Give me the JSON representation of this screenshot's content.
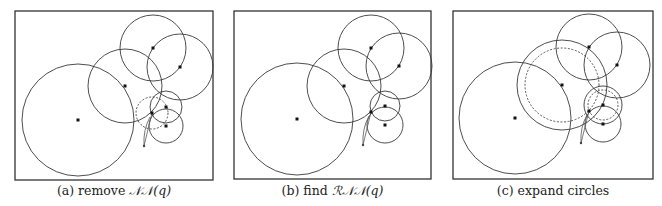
{
  "figure": {
    "panels": [
      {
        "id": "a",
        "caption_prefix": "(a) remove ",
        "caption_math": "𝒩𝒩(q)",
        "points": [
          {
            "name": "p-big",
            "x": 78,
            "y": 120
          },
          {
            "name": "p-mid",
            "x": 125,
            "y": 86
          },
          {
            "name": "p-top",
            "x": 153,
            "y": 48
          },
          {
            "name": "p-right",
            "x": 180,
            "y": 67
          },
          {
            "name": "p-small-upper",
            "x": 166,
            "y": 107
          },
          {
            "name": "p-small-lower",
            "x": 166,
            "y": 126
          },
          {
            "name": "p-nn",
            "x": 152,
            "y": 113
          }
        ],
        "circles": [
          {
            "name": "circle-big",
            "cx": 78,
            "cy": 120,
            "r": 56,
            "style": "solid"
          },
          {
            "name": "circle-mid",
            "cx": 125,
            "cy": 86,
            "r": 37,
            "style": "solid"
          },
          {
            "name": "circle-top",
            "cx": 153,
            "cy": 48,
            "r": 33,
            "style": "solid"
          },
          {
            "name": "circle-right",
            "cx": 180,
            "cy": 67,
            "r": 33,
            "style": "solid"
          },
          {
            "name": "circle-small-upper",
            "cx": 166,
            "cy": 107,
            "r": 16,
            "style": "solid"
          },
          {
            "name": "circle-small-lower",
            "cx": 166,
            "cy": 126,
            "r": 17,
            "style": "solid"
          },
          {
            "name": "circle-nn-removed",
            "cx": 152,
            "cy": 113,
            "r": 16,
            "style": "dashed"
          }
        ],
        "query": {
          "x": 144,
          "y": 146,
          "target": {
            "x": 152,
            "y": 113
          }
        }
      },
      {
        "id": "b",
        "caption_prefix": "(b) find ",
        "caption_math": "ℛ𝒩𝒩(q)",
        "points": [
          {
            "name": "p-big",
            "x": 297,
            "y": 119
          },
          {
            "name": "p-mid",
            "x": 344,
            "y": 86
          },
          {
            "name": "p-top",
            "x": 371,
            "y": 48
          },
          {
            "name": "p-right",
            "x": 399,
            "y": 66
          },
          {
            "name": "p-small-upper",
            "x": 385,
            "y": 106
          },
          {
            "name": "p-small-lower",
            "x": 385,
            "y": 125
          },
          {
            "name": "p-nn",
            "x": 371,
            "y": 112
          }
        ],
        "circles": [
          {
            "name": "circle-big",
            "cx": 297,
            "cy": 119,
            "r": 56,
            "style": "solid"
          },
          {
            "name": "circle-mid",
            "cx": 344,
            "cy": 86,
            "r": 37,
            "style": "solid"
          },
          {
            "name": "circle-top",
            "cx": 371,
            "cy": 48,
            "r": 33,
            "style": "solid"
          },
          {
            "name": "circle-right",
            "cx": 399,
            "cy": 66,
            "r": 33,
            "style": "solid"
          },
          {
            "name": "circle-small-upper",
            "cx": 385,
            "cy": 106,
            "r": 15,
            "style": "solid"
          },
          {
            "name": "circle-small-lower",
            "cx": 385,
            "cy": 125,
            "r": 18,
            "style": "solid"
          }
        ],
        "query": {
          "x": 363,
          "y": 145,
          "target": {
            "x": 371,
            "y": 112
          }
        }
      },
      {
        "id": "c",
        "caption_prefix": "(c) expand circles",
        "caption_math": "",
        "points": [
          {
            "name": "p-big",
            "x": 515,
            "y": 118
          },
          {
            "name": "p-mid",
            "x": 562,
            "y": 85
          },
          {
            "name": "p-top",
            "x": 589,
            "y": 47
          },
          {
            "name": "p-right",
            "x": 617,
            "y": 65
          },
          {
            "name": "p-small-upper",
            "x": 603,
            "y": 105
          },
          {
            "name": "p-small-lower",
            "x": 603,
            "y": 124
          },
          {
            "name": "p-nn",
            "x": 589,
            "y": 111
          }
        ],
        "circles": [
          {
            "name": "circle-big",
            "cx": 515,
            "cy": 118,
            "r": 56,
            "style": "solid"
          },
          {
            "name": "circle-mid-original",
            "cx": 562,
            "cy": 85,
            "r": 37,
            "style": "dashed"
          },
          {
            "name": "circle-mid-expanded",
            "cx": 562,
            "cy": 85,
            "r": 45,
            "style": "solid"
          },
          {
            "name": "circle-top",
            "cx": 589,
            "cy": 47,
            "r": 33,
            "style": "solid"
          },
          {
            "name": "circle-right",
            "cx": 617,
            "cy": 65,
            "r": 33,
            "style": "solid"
          },
          {
            "name": "circle-small-upper-original",
            "cx": 603,
            "cy": 105,
            "r": 15,
            "style": "dashed"
          },
          {
            "name": "circle-small-upper-expanded",
            "cx": 603,
            "cy": 105,
            "r": 19,
            "style": "solid"
          },
          {
            "name": "circle-small-lower",
            "cx": 603,
            "cy": 124,
            "r": 18,
            "style": "solid"
          }
        ],
        "query": {
          "x": 581,
          "y": 143,
          "target": {
            "x": 589,
            "y": 111
          }
        }
      }
    ]
  }
}
